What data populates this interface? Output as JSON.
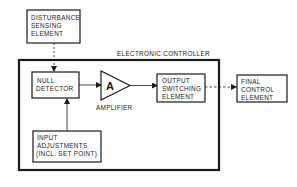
{
  "diagram": {
    "title": "ELECTRONIC CONTROLLER",
    "blocks": {
      "disturbance": {
        "lines": [
          "DISTURBANCE",
          "SENSING",
          "ELEMENT"
        ]
      },
      "null_detector": {
        "lines": [
          "NULL",
          "DETECTOR"
        ]
      },
      "amplifier": {
        "symbol": "A",
        "caption": "AMPLIFIER"
      },
      "output_switching": {
        "lines": [
          "OUTPUT",
          "SWITCHING",
          "ELEMENT"
        ]
      },
      "final_control": {
        "lines": [
          "FINAL",
          "CONTROL",
          "ELEMENT"
        ]
      },
      "input_adjustments": {
        "lines": [
          "INPUT",
          "ADJUSTMENTS",
          "(INCL. SET POINT)"
        ]
      }
    },
    "connections": [
      {
        "from": "disturbance",
        "to": "null_detector",
        "style": "dashed"
      },
      {
        "from": "null_detector",
        "to": "amplifier",
        "style": "solid"
      },
      {
        "from": "amplifier",
        "to": "output_switching",
        "style": "solid"
      },
      {
        "from": "output_switching",
        "to": "final_control",
        "style": "dashed"
      },
      {
        "from": "input_adjustments",
        "to": "null_detector",
        "style": "solid"
      }
    ],
    "colors": {
      "ink": "#1a1a1a",
      "background": "#ffffff"
    }
  }
}
